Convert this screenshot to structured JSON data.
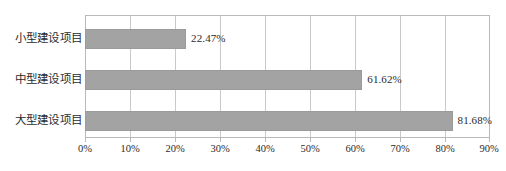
{
  "chart_data": {
    "type": "bar",
    "orientation": "horizontal",
    "title": "",
    "xlabel": "",
    "ylabel": "",
    "categories": [
      "小型建设项目",
      "中型建设项目",
      "大型建设项目"
    ],
    "values": [
      22.47,
      61.62,
      81.68
    ],
    "value_labels": [
      "22.47%",
      "61.62%",
      "81.68%"
    ],
    "xlim": [
      0,
      90
    ],
    "xticks": [
      0,
      10,
      20,
      30,
      40,
      50,
      60,
      70,
      80,
      90
    ],
    "xtick_labels": [
      "0%",
      "10%",
      "20%",
      "30%",
      "40%",
      "50%",
      "60%",
      "70%",
      "80%",
      "90%"
    ],
    "grid": "vertical",
    "legend": null,
    "bar_color": "#a3a3a3",
    "grid_color": "#c9c9c9",
    "axis_color": "#b9b9b9",
    "text_color": "#2b2b2b"
  }
}
